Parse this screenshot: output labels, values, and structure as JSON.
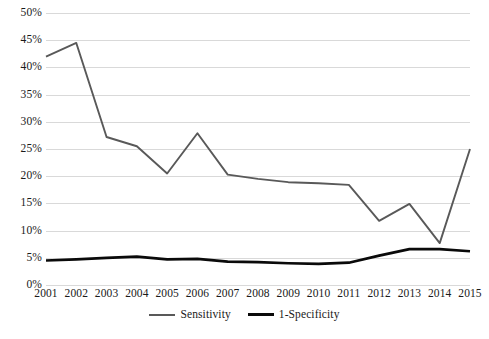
{
  "chart_data": {
    "type": "line",
    "title": "",
    "subtitle": "",
    "xlabel": "",
    "ylabel": "",
    "categories": [
      "2001",
      "2002",
      "2003",
      "2004",
      "2005",
      "2006",
      "2007",
      "2008",
      "2009",
      "2010",
      "2011",
      "2012",
      "2013",
      "2014",
      "2015"
    ],
    "series": [
      {
        "name": "Sensitivity",
        "color": "#595959",
        "values": [
          42.0,
          44.5,
          27.2,
          25.5,
          20.5,
          27.9,
          20.3,
          19.5,
          18.9,
          18.7,
          18.4,
          11.8,
          14.9,
          7.7,
          25.0
        ]
      },
      {
        "name": "1-Specificity",
        "color": "#0a0a0a",
        "values": [
          4.5,
          4.7,
          5.0,
          5.2,
          4.7,
          4.8,
          4.3,
          4.2,
          4.0,
          3.9,
          4.1,
          5.4,
          6.6,
          6.6,
          6.2
        ]
      }
    ],
    "ylim": [
      0,
      50
    ],
    "ytick_step": 5,
    "ytick_labels": [
      "0%",
      "5%",
      "10%",
      "15%",
      "20%",
      "25%",
      "30%",
      "35%",
      "40%",
      "45%",
      "50%"
    ],
    "grid": "horizontal",
    "legend_position": "bottom-center",
    "value_unit": "percent"
  },
  "legend": {
    "entries": [
      {
        "label": "Sensitivity"
      },
      {
        "label": "1-Specificity"
      }
    ]
  }
}
